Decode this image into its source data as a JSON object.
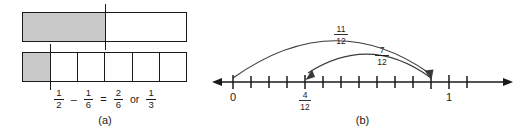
{
  "figure": {
    "panels": [
      {
        "id": "a",
        "label": "(a)",
        "bars": [
          {
            "name": "halves-bar",
            "denominator": 2,
            "shaded_cells": 1,
            "marker_at": "1/2"
          },
          {
            "name": "sixths-bar",
            "denominator": 6,
            "shaded_cells": 1,
            "marker_at": "1/6"
          }
        ],
        "equation": {
          "term1": {
            "num": "1",
            "den": "2"
          },
          "operator": "–",
          "term2": {
            "num": "1",
            "den": "6"
          },
          "equals": "=",
          "result1": {
            "num": "2",
            "den": "6"
          },
          "conjunction": "or",
          "result2": {
            "num": "1",
            "den": "3"
          }
        }
      },
      {
        "id": "b",
        "label": "(b)",
        "numberline": {
          "start_label": "0",
          "end_label": "1",
          "divisions": 12,
          "tick_labels": [
            {
              "position": "4/12",
              "num": "4",
              "den": "12"
            }
          ],
          "arcs": [
            {
              "name": "arc-eleven-twelfths",
              "from": "0",
              "to": "11/12",
              "label": {
                "num": "11",
                "den": "12"
              },
              "direction": "right"
            },
            {
              "name": "arc-seven-twelfths",
              "from": "11/12",
              "to": "4/12",
              "label": {
                "num": "7",
                "den": "12"
              },
              "direction": "left"
            }
          ]
        }
      }
    ]
  },
  "colors": {
    "stroke": "#1a1a1a",
    "shade": "#c9c9c9",
    "background": "#ffffff"
  }
}
